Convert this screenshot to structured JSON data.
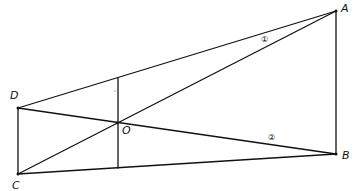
{
  "diagram": {
    "type": "geometry",
    "points": {
      "A": {
        "label": "A",
        "x": 336,
        "y": 11
      },
      "B": {
        "label": "B",
        "x": 336,
        "y": 154
      },
      "C": {
        "label": "C",
        "x": 18,
        "y": 174
      },
      "D": {
        "label": "D",
        "x": 18,
        "y": 108
      },
      "O": {
        "label": "O",
        "x": 117,
        "y": 123
      }
    },
    "segments": [
      {
        "from": "D",
        "to": "A"
      },
      {
        "from": "A",
        "to": "B"
      },
      {
        "from": "C",
        "to": "B"
      },
      {
        "from": "D",
        "to": "C"
      },
      {
        "from": "C",
        "to": "A"
      },
      {
        "from": "D",
        "to": "B"
      },
      {
        "from": "P_top",
        "to": "P_bottom"
      }
    ],
    "vertical_through_O": {
      "x": 118,
      "y_top": 78,
      "y_bottom": 168
    },
    "angle_marks": [
      {
        "label": "①",
        "near": "A",
        "between": [
          "AD",
          "AC"
        ]
      },
      {
        "label": "②",
        "near": "B",
        "between": [
          "BD",
          "BC"
        ]
      }
    ],
    "colors": {
      "line": "#111111",
      "background": "#ffffff"
    }
  }
}
